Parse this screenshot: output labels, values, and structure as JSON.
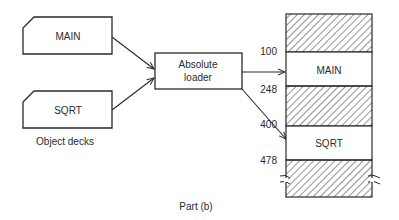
{
  "diagram": {
    "caption": "Part (b)",
    "object_decks": {
      "label": "Object decks",
      "cards": [
        {
          "name": "MAIN"
        },
        {
          "name": "SQRT"
        }
      ]
    },
    "loader": {
      "line1": "Absolute",
      "line2": "loader"
    },
    "memory": {
      "regions": [
        {
          "type": "hatched",
          "label": ""
        },
        {
          "type": "program",
          "label": "MAIN"
        },
        {
          "type": "hatched",
          "label": ""
        },
        {
          "type": "program",
          "label": "SQRT"
        },
        {
          "type": "hatched",
          "label": ""
        }
      ],
      "addresses": [
        "100",
        "248",
        "400",
        "478"
      ]
    },
    "colors": {
      "line": "#2a2a2a",
      "background": "#ffffff"
    }
  }
}
